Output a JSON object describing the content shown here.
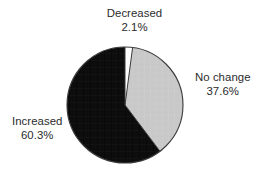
{
  "chart_data": {
    "type": "pie",
    "title": "",
    "subtitle": "",
    "xlabel": "",
    "ylabel": "",
    "legend_position": "none",
    "grid": false,
    "labels_outside": true,
    "start_angle_deg": 0,
    "direction": "clockwise",
    "categories": [
      "Decreased",
      "No change",
      "Increased"
    ],
    "values": [
      2.1,
      37.6,
      60.3
    ],
    "value_unit": "%",
    "slices": [
      {
        "name": "Decreased",
        "value": 2.1,
        "value_label": "2.1%",
        "color": "#fdfdfd",
        "angle_deg": 7.6,
        "label_position": "top"
      },
      {
        "name": "No change",
        "value": 37.6,
        "value_label": "37.6%",
        "color": "#c9c9c9",
        "angle_deg": 135.4,
        "label_position": "right"
      },
      {
        "name": "Increased",
        "value": 60.3,
        "value_label": "60.3%",
        "color": "#0d0d0d",
        "angle_deg": 217.1,
        "label_position": "left"
      }
    ],
    "annotations": []
  },
  "labels": {
    "decreased": {
      "name": "Decreased",
      "value": "2.1%"
    },
    "no_change": {
      "name": "No change",
      "value": "37.6%"
    },
    "increased": {
      "name": "Increased",
      "value": "60.3%"
    }
  },
  "style": {
    "background": "#ffffff",
    "text_color": "#2b2b2b",
    "outline_color": "#3a3a3a",
    "slice_black": "#0d0d0d",
    "slice_gray": "#c9c9c9",
    "slice_white": "#fdfdfd"
  }
}
